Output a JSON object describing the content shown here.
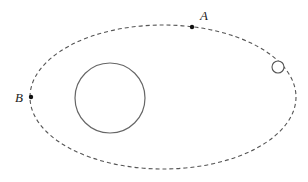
{
  "diagram": {
    "truncated_text_top": "",
    "orbit": {
      "style": "dashed",
      "color": "#555555"
    },
    "central_body": {
      "label": ""
    },
    "satellite": {
      "label": ""
    },
    "points": [
      {
        "label": "A",
        "position": "top of orbit, right of center"
      },
      {
        "label": "B",
        "position": "left end of orbit"
      }
    ]
  }
}
